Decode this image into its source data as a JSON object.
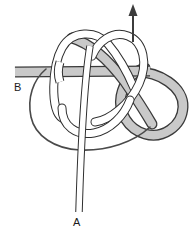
{
  "figure": {
    "type": "knot-diagram",
    "width": 195,
    "height": 235,
    "background_color": "#ffffff"
  },
  "labels": {
    "rope_a": "A",
    "rope_b": "B"
  },
  "colors": {
    "background": "#ffffff",
    "rope_gray_fill": "#c9c9c9",
    "rope_gray_outline": "#3a3a3a",
    "rope_white_fill": "#ffffff",
    "rope_white_outline": "#2e2e2e",
    "thin_line": "#4a4a4a",
    "arrow": "#3c3c3c",
    "label_text": "#1b1b1b"
  },
  "elements": {
    "arrow_name": "direction-arrow-up",
    "arrow_description": "Upward arrow at top indicating pull direction",
    "rope_a_name": "rope-strand-a",
    "rope_b_name": "rope-strand-b",
    "knot_name": "knot-body"
  },
  "geometry": {
    "arrow": {
      "x": 133,
      "tail_y": 42,
      "head_y": 5,
      "head_width": 9,
      "head_length": 11,
      "line_width": 2
    },
    "band_b": {
      "y_top": 67,
      "y_bottom": 77,
      "x_start": 15,
      "x_end": 150
    },
    "rope_a": {
      "x_center": 79,
      "y_bottom": 212,
      "width": 6
    }
  }
}
